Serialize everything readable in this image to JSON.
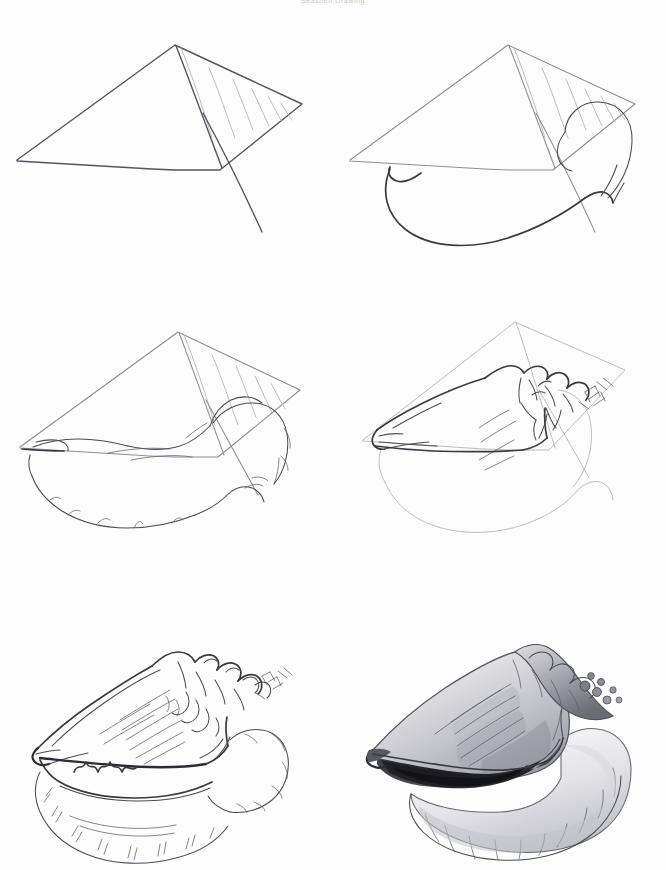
{
  "document": {
    "title": "Seashell Drawing",
    "header_caption": "Seashell Drawing",
    "background_color": "#fdfdfd",
    "subject": "conch seashell",
    "medium": "graphite pencil",
    "width": 666,
    "height": 870
  },
  "palette": {
    "paper": "#fdfdfd",
    "guide_line": "#8d8d96",
    "guide_soft": "#b4b4bd",
    "ink_line": "#3a3a42",
    "ink_heavy": "#2c2c33",
    "shadow_dark": "#2a2a30",
    "shadow_mid": "#9a9aa2",
    "caption_text": "#c9c9cf"
  },
  "tutorial": {
    "type": "step-by-step drawing tutorial",
    "grid": {
      "columns": 2,
      "rows": 3
    },
    "steps": [
      {
        "index": 1,
        "name": "construction-guides",
        "description": "Light pencil construction: a large wedge quadrilateral with a hatched triangular spire section at upper right and a long curved tail line dropping below.",
        "line_weight": "light",
        "shading": "none"
      },
      {
        "index": 2,
        "name": "body-outline",
        "description": "Add the rounded outer lip bulb at right and the long sweeping curve of the shell's lower body over the construction wedge.",
        "line_weight": "light-medium",
        "shading": "none"
      },
      {
        "index": 3,
        "name": "refine-contour",
        "description": "Refine the silhouette with ragged, wavy edges; define the aperture opening line and the scalloped flare of the lip.",
        "line_weight": "medium",
        "shading": "none"
      },
      {
        "index": 4,
        "name": "spire-and-knobs",
        "description": "Darken the upper contour and build the knobby spire with spiky nodules and cross-hatched texture at the apex.",
        "line_weight": "medium-dark",
        "shading": "none"
      },
      {
        "index": 5,
        "name": "full-line-detail",
        "description": "Complete linework: radiating ridge lines across the body whorl, zigzag teeth inside the aperture, and radial ticks on the scalloped lip.",
        "line_weight": "dark",
        "shading": "none"
      },
      {
        "index": 6,
        "name": "finished-shading",
        "description": "Finished rendering with graphite tone: deep black aperture interior, soft gradient across the body whorl, highlights on the lip.",
        "line_weight": "dark",
        "shading": "full tonal rendering"
      }
    ]
  }
}
